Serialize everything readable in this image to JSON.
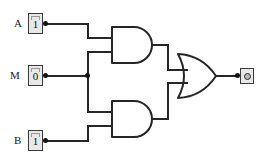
{
  "circuit": {
    "title": "logic-circuit",
    "colors": {
      "wire": "#262626",
      "gate_stroke": "#262626",
      "gate_fill": "#ffffff",
      "box_fill": "#e8e8e8",
      "box_border": "#3a3a3a",
      "node": "#141414",
      "background": "#ffffff"
    },
    "inputs": [
      {
        "name": "A",
        "label": "A",
        "value": "1",
        "icon": "toggle-switch-icon"
      },
      {
        "name": "M",
        "label": "M",
        "value": "0",
        "icon": "toggle-switch-icon"
      },
      {
        "name": "B",
        "label": "B",
        "value": "1",
        "icon": "toggle-switch-icon"
      }
    ],
    "gates": [
      {
        "name": "and-gate-top",
        "type": "AND",
        "inputs": [
          "A",
          "M"
        ]
      },
      {
        "name": "and-gate-bottom",
        "type": "AND",
        "inputs": [
          "M",
          "B"
        ]
      },
      {
        "name": "or-gate",
        "type": "OR",
        "inputs": [
          "and-gate-top",
          "and-gate-bottom"
        ]
      }
    ],
    "output": {
      "name": "output-led",
      "icon": "led-indicator-icon",
      "state": "off"
    },
    "junctions": [
      {
        "name": "junction-m-branch"
      }
    ]
  }
}
